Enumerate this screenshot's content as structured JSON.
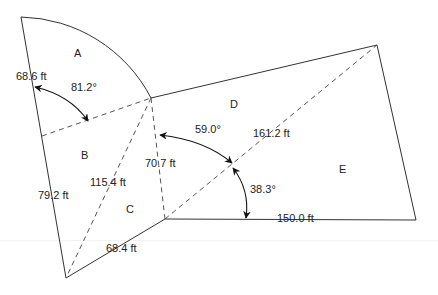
{
  "diagram": {
    "type": "land-plot survey diagram",
    "regions": [
      {
        "id": "A",
        "label": "A"
      },
      {
        "id": "B",
        "label": "B"
      },
      {
        "id": "C",
        "label": "C"
      },
      {
        "id": "D",
        "label": "D"
      },
      {
        "id": "E",
        "label": "E"
      }
    ],
    "lengths": [
      {
        "id": "left-top",
        "label": "68.6 ft"
      },
      {
        "id": "left-bottom",
        "label": "79.2 ft"
      },
      {
        "id": "diag-b-c",
        "label": "115.4 ft"
      },
      {
        "id": "center-down",
        "label": "70.7 ft"
      },
      {
        "id": "bottom-left",
        "label": "68.4 ft"
      },
      {
        "id": "diag-d-e",
        "label": "161.2 ft"
      },
      {
        "id": "bottom-right",
        "label": "150.0 ft"
      }
    ],
    "angles": [
      {
        "id": "sector-a",
        "label": "81.2°"
      },
      {
        "id": "c-d",
        "label": "59.0°"
      },
      {
        "id": "e-bottom",
        "label": "38.3°"
      }
    ],
    "colors": {
      "line": "#333333",
      "dash": "#555555",
      "text": "#222222"
    }
  }
}
